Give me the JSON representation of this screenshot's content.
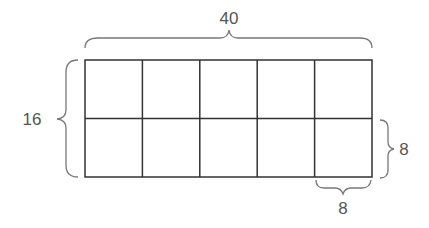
{
  "diagram": {
    "type": "area-model-grid",
    "rows": 2,
    "columns": 5,
    "labels": {
      "top_width": "40",
      "left_height": "16",
      "right_cell_height": "8",
      "bottom_cell_width": "8"
    },
    "colors": {
      "grid_line": "#333333",
      "brace": "#777777",
      "text": "#555555"
    }
  }
}
